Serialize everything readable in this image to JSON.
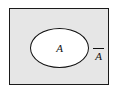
{
  "figure": {
    "type": "venn-diagram",
    "universe": {
      "name": "universal-set-rectangle",
      "fill_color": "#e6e6e6",
      "border_color": "#1a1a1a"
    },
    "set": {
      "name": "set-A",
      "label": "A",
      "fill_color": "#ffffff",
      "border_color": "#111111"
    },
    "complement": {
      "name": "complement-of-A",
      "label": "A",
      "overbar": true
    }
  }
}
